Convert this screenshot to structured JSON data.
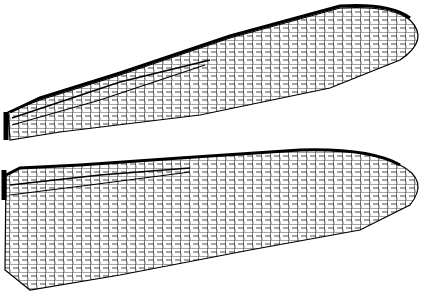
{
  "image": {
    "subject": "dragonfly wings line drawing",
    "background": "#ffffff",
    "ink": "#000000",
    "wings": [
      {
        "name": "forewing",
        "position": "top"
      },
      {
        "name": "hindwing",
        "position": "bottom"
      }
    ]
  }
}
